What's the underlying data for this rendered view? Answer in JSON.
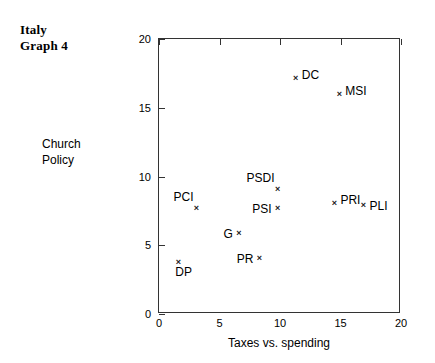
{
  "title": {
    "line1": "Italy",
    "line2": "Graph 4"
  },
  "axes": {
    "y_title_line1": "Church",
    "y_title_line2": "Policy",
    "x_title": "Taxes vs. spending"
  },
  "chart_data": {
    "type": "scatter",
    "title": "Italy Graph 4",
    "xlabel": "Taxes vs. spending",
    "ylabel": "Church Policy",
    "xlim": [
      0,
      20
    ],
    "ylim": [
      0,
      20
    ],
    "xticks": [
      0,
      5,
      10,
      15,
      20
    ],
    "yticks": [
      0,
      5,
      10,
      15,
      20
    ],
    "xtick_labels": [
      "0",
      "5",
      "10",
      "15",
      "20"
    ],
    "ytick_labels": [
      "0",
      "5",
      "10",
      "15",
      "20"
    ],
    "grid": false,
    "legend": null,
    "marker": "x",
    "points": [
      {
        "label": "DC",
        "x": 11.3,
        "y": 17.2,
        "label_pos": "right"
      },
      {
        "label": "MSI",
        "x": 14.9,
        "y": 16.0,
        "label_pos": "right"
      },
      {
        "label": "PSDI",
        "x": 9.8,
        "y": 9.1,
        "label_pos": "above-left"
      },
      {
        "label": "PSI",
        "x": 9.8,
        "y": 7.7,
        "label_pos": "left"
      },
      {
        "label": "PCI",
        "x": 3.1,
        "y": 7.7,
        "label_pos": "above-left"
      },
      {
        "label": "PRI",
        "x": 14.5,
        "y": 8.1,
        "label_pos": "right"
      },
      {
        "label": "PLI",
        "x": 16.9,
        "y": 7.9,
        "label_pos": "right-mid"
      },
      {
        "label": "G",
        "x": 6.6,
        "y": 5.9,
        "label_pos": "left"
      },
      {
        "label": "PR",
        "x": 8.3,
        "y": 4.1,
        "label_pos": "left"
      },
      {
        "label": "DP",
        "x": 1.6,
        "y": 3.8,
        "label_pos": "below"
      }
    ]
  }
}
